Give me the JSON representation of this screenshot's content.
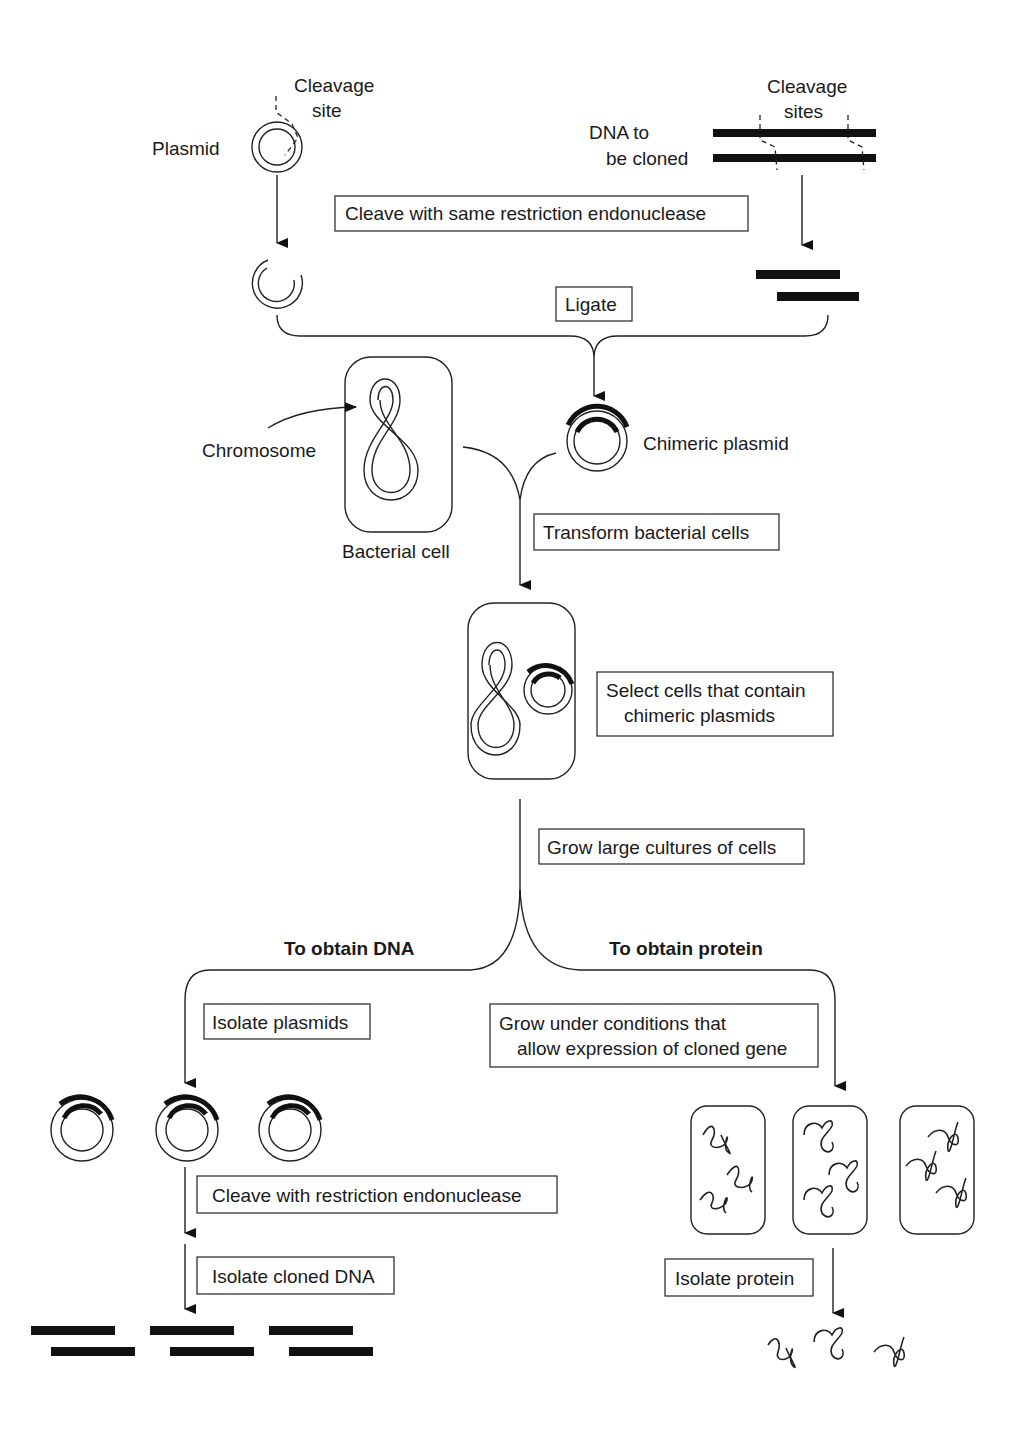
{
  "diagram": {
    "labels": {
      "plasmid": "Plasmid",
      "cleavage_site_line1": "Cleavage",
      "cleavage_site_line2": "site",
      "cleavage_sites_line1": "Cleavage",
      "cleavage_sites_line2": "sites",
      "dna_to_be_cloned_line1": "DNA to",
      "dna_to_be_cloned_line2": "be cloned",
      "chromosome": "Chromosome",
      "bacterial_cell": "Bacterial cell",
      "chimeric_plasmid": "Chimeric plasmid",
      "to_obtain_dna": "To obtain DNA",
      "to_obtain_protein": "To obtain protein"
    },
    "steps": {
      "cleave_same": "Cleave with same restriction endonuclease",
      "ligate": "Ligate",
      "transform": "Transform bacterial cells",
      "select_line1": "Select cells that contain",
      "select_line2": "chimeric plasmids",
      "grow_cultures": "Grow large cultures of cells",
      "isolate_plasmids": "Isolate plasmids",
      "grow_conditions_line1": "Grow under conditions that",
      "grow_conditions_line2": "allow expression of cloned gene",
      "cleave_restriction": "Cleave with restriction endonuclease",
      "isolate_cloned_dna": "Isolate cloned DNA",
      "isolate_protein": "Isolate protein"
    }
  }
}
